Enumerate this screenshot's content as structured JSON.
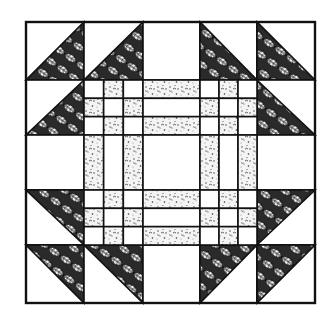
{
  "colors": {
    "background": "#ffffff",
    "line": "#111111",
    "leaf_fill": "#1a1a1a",
    "speckle_fill": "#f2f2f2",
    "speckle_dot": "#333333"
  },
  "block": {
    "x": 26,
    "y": 22,
    "right": 315,
    "bottom": 303,
    "grid_cols": [
      26,
      84,
      143,
      200,
      257,
      315
    ],
    "grid_rows": [
      22,
      80,
      135,
      190,
      245,
      303
    ]
  },
  "border_cells": [
    {
      "row": 0,
      "col": 0,
      "type": "half-triangle",
      "dark": "lower-right"
    },
    {
      "row": 0,
      "col": 1,
      "type": "half-triangle",
      "dark": "lower-right"
    },
    {
      "row": 0,
      "col": 2,
      "type": "plain"
    },
    {
      "row": 0,
      "col": 3,
      "type": "half-triangle",
      "dark": "lower-left"
    },
    {
      "row": 0,
      "col": 4,
      "type": "half-triangle",
      "dark": "lower-left"
    },
    {
      "row": 1,
      "col": 0,
      "type": "half-triangle",
      "dark": "lower-right"
    },
    {
      "row": 1,
      "col": 4,
      "type": "half-triangle",
      "dark": "lower-left"
    },
    {
      "row": 2,
      "col": 0,
      "type": "plain"
    },
    {
      "row": 2,
      "col": 4,
      "type": "plain"
    },
    {
      "row": 3,
      "col": 0,
      "type": "half-triangle",
      "dark": "upper-right"
    },
    {
      "row": 3,
      "col": 4,
      "type": "half-triangle",
      "dark": "upper-left"
    },
    {
      "row": 4,
      "col": 0,
      "type": "half-triangle",
      "dark": "upper-right"
    },
    {
      "row": 4,
      "col": 1,
      "type": "half-triangle",
      "dark": "upper-right"
    },
    {
      "row": 4,
      "col": 2,
      "type": "plain"
    },
    {
      "row": 4,
      "col": 3,
      "type": "half-triangle",
      "dark": "upper-left"
    },
    {
      "row": 4,
      "col": 4,
      "type": "half-triangle",
      "dark": "upper-left"
    }
  ],
  "inner_cells": [
    {
      "row": 1,
      "col": 1,
      "type": "nine-patch"
    },
    {
      "row": 1,
      "col": 2,
      "type": "strips-horizontal"
    },
    {
      "row": 1,
      "col": 3,
      "type": "nine-patch"
    },
    {
      "row": 2,
      "col": 1,
      "type": "strips-vertical"
    },
    {
      "row": 2,
      "col": 2,
      "type": "plain"
    },
    {
      "row": 2,
      "col": 3,
      "type": "strips-vertical"
    },
    {
      "row": 3,
      "col": 1,
      "type": "nine-patch"
    },
    {
      "row": 3,
      "col": 2,
      "type": "strips-horizontal"
    },
    {
      "row": 3,
      "col": 3,
      "type": "nine-patch"
    }
  ]
}
